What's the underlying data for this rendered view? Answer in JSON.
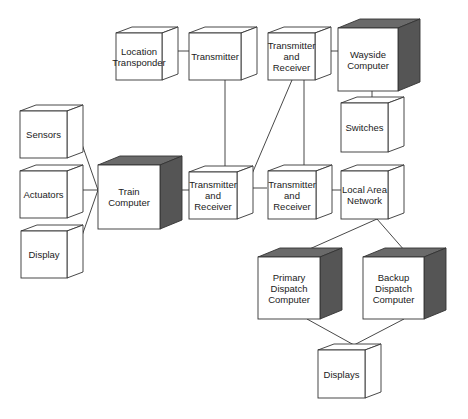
{
  "diagram": {
    "type": "deployment-diagram",
    "colors": {
      "stroke": "#333333",
      "face": "#ffffff",
      "shade": "#555555",
      "shade_top": "#6a6a6a"
    },
    "nodes": [
      {
        "id": "location_transponder",
        "label": "Location\nTransponder",
        "x": 116,
        "y": 33,
        "w": 46,
        "h": 47,
        "d": 16,
        "shaded": false
      },
      {
        "id": "transmitter_top",
        "label": "Transmitter",
        "x": 189,
        "y": 33,
        "w": 52,
        "h": 47,
        "d": 16,
        "shaded": false
      },
      {
        "id": "tr_top_right",
        "label": "Transmitter\nand\nReceiver",
        "x": 268,
        "y": 33,
        "w": 47,
        "h": 47,
        "d": 16,
        "shaded": false
      },
      {
        "id": "wayside_computer",
        "label": "Wayside\nComputer",
        "x": 338,
        "y": 28,
        "w": 60,
        "h": 63,
        "d": 22,
        "shaded": true
      },
      {
        "id": "switches",
        "label": "Switches",
        "x": 341,
        "y": 103,
        "w": 47,
        "h": 49,
        "d": 16,
        "shaded": false
      },
      {
        "id": "sensors",
        "label": "Sensors",
        "x": 20,
        "y": 111,
        "w": 47,
        "h": 47,
        "d": 16,
        "shaded": false
      },
      {
        "id": "actuators",
        "label": "Actuators",
        "x": 20,
        "y": 171,
        "w": 47,
        "h": 47,
        "d": 16,
        "shaded": false
      },
      {
        "id": "display",
        "label": "Display",
        "x": 21,
        "y": 231,
        "w": 46,
        "h": 47,
        "d": 16,
        "shaded": false
      },
      {
        "id": "train_computer",
        "label": "Train\nComputer",
        "x": 98,
        "y": 165,
        "w": 62,
        "h": 64,
        "d": 22,
        "shaded": true
      },
      {
        "id": "tr_middle",
        "label": "Transmitter\nand\nReceiver",
        "x": 189,
        "y": 172,
        "w": 48,
        "h": 47,
        "d": 16,
        "shaded": false
      },
      {
        "id": "tr_right",
        "label": "Transmitter\nand\nReceiver",
        "x": 268,
        "y": 171,
        "w": 48,
        "h": 48,
        "d": 16,
        "shaded": false
      },
      {
        "id": "lan",
        "label": "Local Area\nNetwork",
        "x": 341,
        "y": 171,
        "w": 47,
        "h": 48,
        "d": 16,
        "shaded": false
      },
      {
        "id": "primary_dispatch",
        "label": "Primary\nDispatch\nComputer",
        "x": 258,
        "y": 257,
        "w": 62,
        "h": 62,
        "d": 22,
        "shaded": true
      },
      {
        "id": "backup_dispatch",
        "label": "Backup\nDispatch\nComputer",
        "x": 363,
        "y": 257,
        "w": 61,
        "h": 62,
        "d": 22,
        "shaded": true
      },
      {
        "id": "displays",
        "label": "Displays",
        "x": 318,
        "y": 350,
        "w": 47,
        "h": 48,
        "d": 16,
        "shaded": false
      }
    ],
    "links": [
      {
        "from": "location_transponder",
        "to": "transmitter_top",
        "points": [
          [
            172,
            51
          ],
          [
            199,
            51
          ]
        ]
      },
      {
        "from": "transmitter_top",
        "to": "tr_middle",
        "points": [
          [
            225,
            80
          ],
          [
            225,
            166
          ]
        ]
      },
      {
        "from": "tr_top_right",
        "to": "wayside_computer",
        "points": [
          [
            325,
            51
          ],
          [
            338,
            51
          ]
        ]
      },
      {
        "from": "wayside_computer",
        "to": "switches",
        "points": [
          [
            372,
            91
          ],
          [
            372,
            99
          ]
        ]
      },
      {
        "from": "tr_top_right",
        "to": "tr_right",
        "points": [
          [
            304,
            80
          ],
          [
            304,
            166
          ]
        ]
      },
      {
        "from": "tr_top_right",
        "to": "tr_middle",
        "points": [
          [
            292,
            80
          ],
          [
            246,
            188
          ],
          [
            267,
            188
          ]
        ]
      },
      {
        "from": "sensors",
        "to": "train_computer",
        "points": [
          [
            77,
            130
          ],
          [
            98,
            190
          ]
        ]
      },
      {
        "from": "actuators",
        "to": "train_computer",
        "points": [
          [
            77,
            190
          ],
          [
            98,
            190
          ]
        ]
      },
      {
        "from": "display",
        "to": "train_computer",
        "points": [
          [
            77,
            250
          ],
          [
            98,
            190
          ]
        ]
      },
      {
        "from": "train_computer",
        "to": "tr_middle",
        "points": [
          [
            170,
            190
          ],
          [
            189,
            190
          ]
        ]
      },
      {
        "from": "tr_right",
        "to": "lan",
        "points": [
          [
            325,
            190
          ],
          [
            341,
            190
          ]
        ]
      },
      {
        "from": "lan",
        "to": "primary_dispatch",
        "points": [
          [
            377,
            219
          ],
          [
            305,
            251
          ]
        ]
      },
      {
        "from": "lan",
        "to": "backup_dispatch",
        "points": [
          [
            377,
            219
          ],
          [
            405,
            251
          ]
        ]
      },
      {
        "from": "primary_dispatch",
        "to": "displays",
        "points": [
          [
            307,
            319
          ],
          [
            354,
            345
          ]
        ]
      },
      {
        "from": "backup_dispatch",
        "to": "displays",
        "points": [
          [
            404,
            319
          ],
          [
            354,
            345
          ]
        ]
      }
    ]
  }
}
